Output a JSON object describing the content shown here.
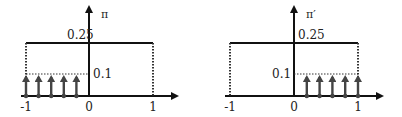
{
  "panels": [
    {
      "id": "pi",
      "ylabel": "π",
      "level_high": "0.25",
      "level_low": "0.1",
      "xticks": [
        "-1",
        "0",
        "1"
      ],
      "impulse_side": "left",
      "impulse_count": 5,
      "geom": {
        "x0": 89,
        "xm1": 26,
        "xp1": 153,
        "ytop": 5,
        "yaxis_end": 177,
        "xstart": 21
      }
    },
    {
      "id": "pi-prime",
      "ylabel": "π′",
      "level_high": "0.25",
      "level_low": "0.1",
      "xticks": [
        "-1",
        "0",
        "1"
      ],
      "impulse_side": "right",
      "impulse_count": 5,
      "geom": {
        "x0": 294,
        "xm1": 230,
        "xp1": 358,
        "ytop": 5,
        "yaxis_end": 382,
        "xstart": 225
      }
    }
  ],
  "colors": {
    "axis": "#111111",
    "impulse": "#444444",
    "dotted": "#333333"
  }
}
